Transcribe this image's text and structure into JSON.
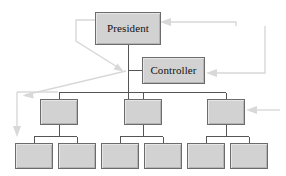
{
  "diagram": {
    "type": "organizational-chart",
    "canvas": {
      "width": 286,
      "height": 176,
      "background": "#ffffff"
    },
    "style": {
      "box_fill": "#d2d2d2",
      "box_border": "#6b6b6b",
      "connector_color": "#555555",
      "annotation_color": "#d8d8d8",
      "label_color": "#111111"
    },
    "nodes": [
      {
        "id": "president",
        "label": "President",
        "level": 1,
        "x": 95,
        "y": 12,
        "width": 66,
        "height": 33,
        "has_label": true
      },
      {
        "id": "controller",
        "label": "Controller",
        "level": 2,
        "x": 142,
        "y": 57,
        "width": 63,
        "height": 27,
        "has_label": true
      },
      {
        "id": "mid-1",
        "label": "",
        "level": 3,
        "x": 40,
        "y": 99,
        "width": 38,
        "height": 26,
        "has_label": false
      },
      {
        "id": "mid-2",
        "label": "",
        "level": 3,
        "x": 124,
        "y": 99,
        "width": 38,
        "height": 26,
        "has_label": false
      },
      {
        "id": "mid-3",
        "label": "",
        "level": 3,
        "x": 207,
        "y": 99,
        "width": 38,
        "height": 26,
        "has_label": false
      },
      {
        "id": "leaf-1",
        "label": "",
        "level": 4,
        "x": 15,
        "y": 143,
        "width": 38,
        "height": 26,
        "has_label": false
      },
      {
        "id": "leaf-2",
        "label": "",
        "level": 4,
        "x": 58,
        "y": 143,
        "width": 38,
        "height": 26,
        "has_label": false
      },
      {
        "id": "leaf-3",
        "label": "",
        "level": 4,
        "x": 101,
        "y": 143,
        "width": 38,
        "height": 26,
        "has_label": false
      },
      {
        "id": "leaf-4",
        "label": "",
        "level": 4,
        "x": 144,
        "y": 143,
        "width": 38,
        "height": 26,
        "has_label": false
      },
      {
        "id": "leaf-5",
        "label": "",
        "level": 4,
        "x": 187,
        "y": 143,
        "width": 38,
        "height": 26,
        "has_label": false
      },
      {
        "id": "leaf-6",
        "label": "",
        "level": 4,
        "x": 230,
        "y": 143,
        "width": 38,
        "height": 26,
        "has_label": false
      }
    ],
    "connectors": [
      {
        "from": "president",
        "to": "trunk-junction",
        "kind": "vertical"
      },
      {
        "from": "trunk",
        "to": "controller",
        "kind": "horizontal-stub"
      },
      {
        "from": "trunk",
        "to": "mid-1",
        "kind": "elbow"
      },
      {
        "from": "trunk",
        "to": "mid-2",
        "kind": "elbow"
      },
      {
        "from": "trunk",
        "to": "mid-3",
        "kind": "elbow"
      },
      {
        "from": "mid-1",
        "to": "leaf-1",
        "kind": "elbow"
      },
      {
        "from": "mid-1",
        "to": "leaf-2",
        "kind": "elbow"
      },
      {
        "from": "mid-2",
        "to": "leaf-3",
        "kind": "elbow"
      },
      {
        "from": "mid-2",
        "to": "leaf-4",
        "kind": "elbow"
      },
      {
        "from": "mid-3",
        "to": "leaf-5",
        "kind": "elbow"
      },
      {
        "from": "mid-3",
        "to": "leaf-6",
        "kind": "elbow"
      }
    ],
    "annotations": [
      {
        "id": "ann-president-left-loop",
        "target": "trunk-junction",
        "direction": "down-right",
        "note": "callout from President left side down to trunk junction"
      },
      {
        "id": "ann-junction-to-left",
        "target": "mid-row-left",
        "direction": "down-left",
        "note": "callout from trunk junction down-left"
      },
      {
        "id": "ann-into-president",
        "target": "president",
        "direction": "left",
        "note": "arrow entering President right edge"
      },
      {
        "id": "ann-into-controller",
        "target": "controller",
        "direction": "left",
        "note": "arrow entering Controller right edge"
      },
      {
        "id": "ann-into-mid-3",
        "target": "mid-3",
        "direction": "left",
        "note": "arrow entering third middle box right edge"
      },
      {
        "id": "ann-far-left-down",
        "target": "leaf-1",
        "direction": "down",
        "note": "vertical line at far left ending in down arrow"
      }
    ]
  }
}
